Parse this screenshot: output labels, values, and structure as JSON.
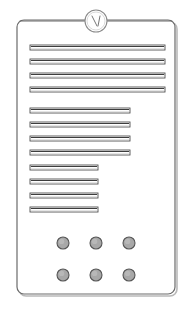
{
  "illustration": {
    "title": "Door Entry Intercom Panel",
    "style": "technical-line-drawing",
    "canvas": {
      "width": 193,
      "height": 310
    },
    "colors": {
      "background": "#ffffff",
      "outline": "#6b6b6b",
      "outline_light": "#9a9a9a",
      "shadow": "#b9b9b9",
      "slot_fill": "#ffffff",
      "slot_edge_dark": "#4f4f4f",
      "slot_edge_light": "#c9c9c9",
      "button_fill": "#a8a8a8",
      "button_edge": "#555555"
    }
  },
  "panel": {
    "name": "intercom-faceplate",
    "x": 17,
    "y": 20,
    "width": 158,
    "height": 274,
    "corner_radius": 7,
    "border_color": "#6b6b6b",
    "shadow_offset": 2
  },
  "lens": {
    "name": "camera-lens",
    "cx": 96,
    "cy": 21,
    "r": 11,
    "inner_r": 9,
    "stroke": "#8a8a8a",
    "marks": [
      {
        "x1": 92,
        "y1": 16,
        "x2": 97,
        "y2": 26
      },
      {
        "x1": 100,
        "y1": 16,
        "x2": 98,
        "y2": 26
      }
    ]
  },
  "top_rails": [
    {
      "name": "top-rail-left",
      "x1": 20,
      "y": 21,
      "x2": 85
    },
    {
      "name": "top-rail-right",
      "x1": 107,
      "y": 21,
      "x2": 172
    }
  ],
  "speaker_groups": [
    {
      "name": "speaker-grille-group-1",
      "label": "Upper grille",
      "slot_x": 30,
      "slot_width": 135,
      "slot_height": 5,
      "count": 4,
      "start_y": 45,
      "pitch": 14
    },
    {
      "name": "speaker-grille-group-2",
      "label": "Middle grille",
      "slot_x": 30,
      "slot_width": 100,
      "slot_height": 5,
      "count": 4,
      "start_y": 108,
      "pitch": 14
    },
    {
      "name": "speaker-grille-group-3",
      "label": "Lower grille",
      "slot_x": 30,
      "slot_width": 68,
      "slot_height": 5,
      "count": 4,
      "start_y": 165,
      "pitch": 14
    }
  ],
  "call_buttons": {
    "name": "call-button-grid",
    "radius": 6,
    "columns_x": [
      63,
      96,
      129
    ],
    "rows_y": [
      243,
      275
    ],
    "items": [
      {
        "name": "call-button-1",
        "row": 0,
        "col": 0
      },
      {
        "name": "call-button-2",
        "row": 0,
        "col": 1
      },
      {
        "name": "call-button-3",
        "row": 0,
        "col": 2
      },
      {
        "name": "call-button-4",
        "row": 1,
        "col": 0
      },
      {
        "name": "call-button-5",
        "row": 1,
        "col": 1
      },
      {
        "name": "call-button-6",
        "row": 1,
        "col": 2
      }
    ]
  }
}
